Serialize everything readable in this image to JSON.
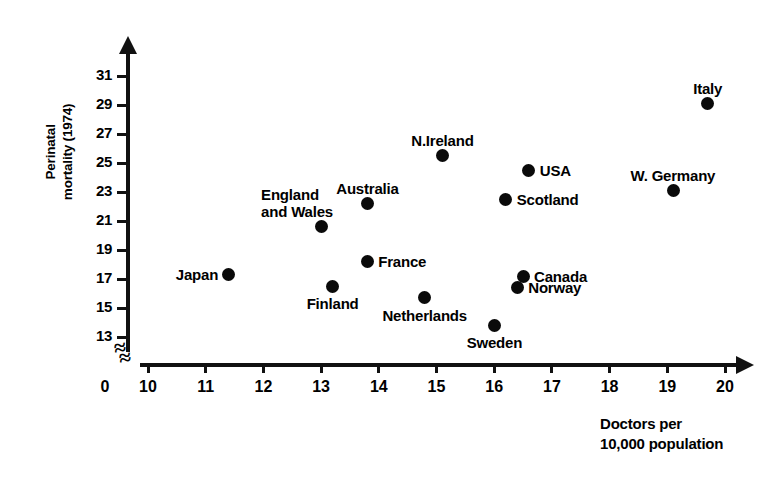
{
  "chart_data": {
    "type": "scatter",
    "title": "",
    "xlabel": "Doctors per\n10,000 population",
    "xlabel_line1": "Doctors per",
    "xlabel_line2": "10,000 population",
    "ylabel": "Perinatal mortality (1974)",
    "ylabel_line1": "Perinatal",
    "ylabel_line2": "mortality (1974)",
    "origin_label": "0",
    "xlim": [
      10,
      20
    ],
    "ylim": [
      13,
      31
    ],
    "xticks": [
      10,
      11,
      12,
      13,
      14,
      15,
      16,
      17,
      18,
      19,
      20
    ],
    "xtick_labels": [
      "10",
      "11",
      "12",
      "13",
      "14",
      "15",
      "16",
      "17",
      "18",
      "19",
      "20"
    ],
    "yticks": [
      13,
      15,
      17,
      19,
      21,
      23,
      25,
      27,
      29,
      31
    ],
    "ytick_labels": [
      "13",
      "15",
      "17",
      "19",
      "21",
      "23",
      "25",
      "27",
      "29",
      "31"
    ],
    "grid": false,
    "legend": "none",
    "axis_break_x": true,
    "axis_break_y": true,
    "marker_color": "#0a0a0a",
    "axis_color": "#111111",
    "points": [
      {
        "label": "Japan",
        "x": 11.4,
        "y": 17.3,
        "label_pos": "left"
      },
      {
        "label": "England\nand Wales",
        "label_line1": "England",
        "label_line2": "and Wales",
        "x": 13.0,
        "y": 20.6,
        "label_pos": "above-left"
      },
      {
        "label": "Finland",
        "x": 13.2,
        "y": 16.5,
        "label_pos": "below"
      },
      {
        "label": "Australia",
        "x": 13.8,
        "y": 22.2,
        "label_pos": "above"
      },
      {
        "label": "France",
        "x": 13.8,
        "y": 18.2,
        "label_pos": "right"
      },
      {
        "label": "Netherlands",
        "x": 14.8,
        "y": 15.7,
        "label_pos": "below"
      },
      {
        "label": "N.Ireland",
        "x": 15.1,
        "y": 25.5,
        "label_pos": "above"
      },
      {
        "label": "Sweden",
        "x": 16.0,
        "y": 13.8,
        "label_pos": "below"
      },
      {
        "label": "Scotland",
        "x": 16.2,
        "y": 22.5,
        "label_pos": "right"
      },
      {
        "label": "Norway",
        "x": 16.4,
        "y": 16.4,
        "label_pos": "right"
      },
      {
        "label": "Canada",
        "x": 16.5,
        "y": 17.2,
        "label_pos": "right"
      },
      {
        "label": "USA",
        "x": 16.6,
        "y": 24.5,
        "label_pos": "right"
      },
      {
        "label": "W. Germany",
        "x": 19.1,
        "y": 23.1,
        "label_pos": "above"
      },
      {
        "label": "Italy",
        "x": 19.7,
        "y": 29.1,
        "label_pos": "above"
      }
    ]
  }
}
